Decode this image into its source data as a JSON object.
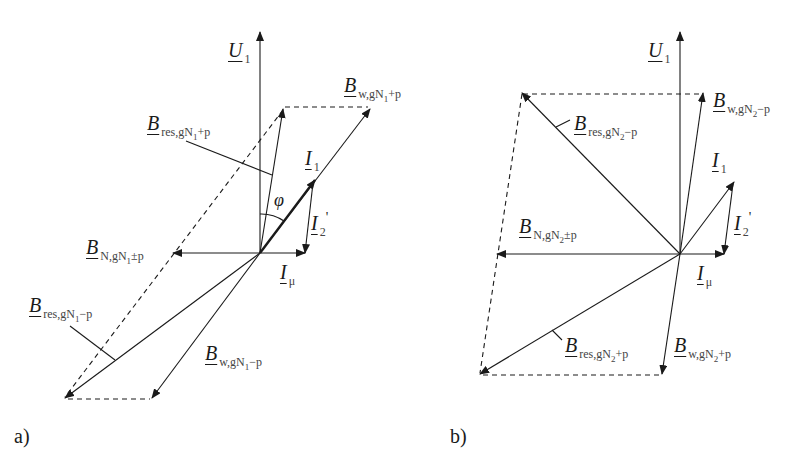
{
  "panels": [
    {
      "id": "a",
      "label": "a)",
      "vectors": {
        "U1": {
          "main": "U",
          "sub": "1"
        },
        "I1": {
          "main": "I",
          "sub": "1"
        },
        "I2p": {
          "main": "I",
          "sub": "2",
          "prime": "'"
        },
        "Imu": {
          "main": "I",
          "sub": "μ"
        },
        "B_w_plus": {
          "main": "B",
          "sub": "w,gN",
          "sub2": "1",
          "tail": "+p"
        },
        "B_res_plus": {
          "main": "B",
          "sub": "res,gN",
          "sub2": "1",
          "tail": "+p"
        },
        "B_N": {
          "main": "B",
          "sub": "N,gN",
          "sub2": "1",
          "tail": "±p"
        },
        "B_res_minus": {
          "main": "B",
          "sub": "res,gN",
          "sub2": "1",
          "tail": "−p"
        },
        "B_w_minus": {
          "main": "B",
          "sub": "w,gN",
          "sub2": "1",
          "tail": "−p"
        }
      },
      "angle": "φ"
    },
    {
      "id": "b",
      "label": "b)",
      "vectors": {
        "U1": {
          "main": "U",
          "sub": "1"
        },
        "I1": {
          "main": "I",
          "sub": "1"
        },
        "I2p": {
          "main": "I",
          "sub": "2",
          "prime": "'"
        },
        "Imu": {
          "main": "I",
          "sub": "μ"
        },
        "B_w_minus": {
          "main": "B",
          "sub": "w,gN",
          "sub2": "2",
          "tail": "−p"
        },
        "B_res_minus": {
          "main": "B",
          "sub": "res,gN",
          "sub2": "2",
          "tail": "−p"
        },
        "B_N": {
          "main": "B",
          "sub": "N,gN",
          "sub2": "2",
          "tail": "±p"
        },
        "B_res_plus": {
          "main": "B",
          "sub": "res,gN",
          "sub2": "2",
          "tail": "+p"
        },
        "B_w_plus": {
          "main": "B",
          "sub": "w,gN",
          "sub2": "2",
          "tail": "+p"
        }
      }
    }
  ]
}
